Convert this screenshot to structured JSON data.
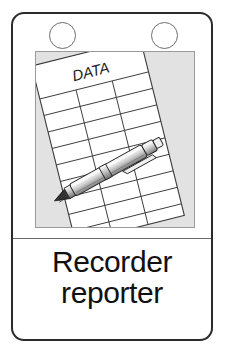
{
  "card": {
    "title_line_1": "Recorder",
    "title_line_2": "reporter",
    "holes": [
      {
        "name": "punch-hole-left"
      },
      {
        "name": "punch-hole-right"
      }
    ],
    "colors": {
      "card_border": "#2b2b2b",
      "card_background": "#ffffff",
      "panel_background": "#e2e2e2",
      "panel_border": "#9a9a9a",
      "divider": "#6b6b6b",
      "caption_text": "#111111",
      "paper": "#ffffff",
      "paper_line": "#3a3a3a",
      "pen_body_light": "#f2f2f2",
      "pen_body_mid": "#c9c9c9",
      "pen_body_dark": "#8e8e8e",
      "pen_tip": "#2a2a2a"
    }
  },
  "illustration": {
    "name": "data-sheet-with-pen-illustration",
    "paper": {
      "name": "data-sheet",
      "header_label": "DATA",
      "columns": 3,
      "rows": 9
    },
    "pen": {
      "name": "pen",
      "parts": [
        "tip",
        "grip-band",
        "barrel",
        "mid-band",
        "cap-button",
        "clip"
      ]
    }
  }
}
